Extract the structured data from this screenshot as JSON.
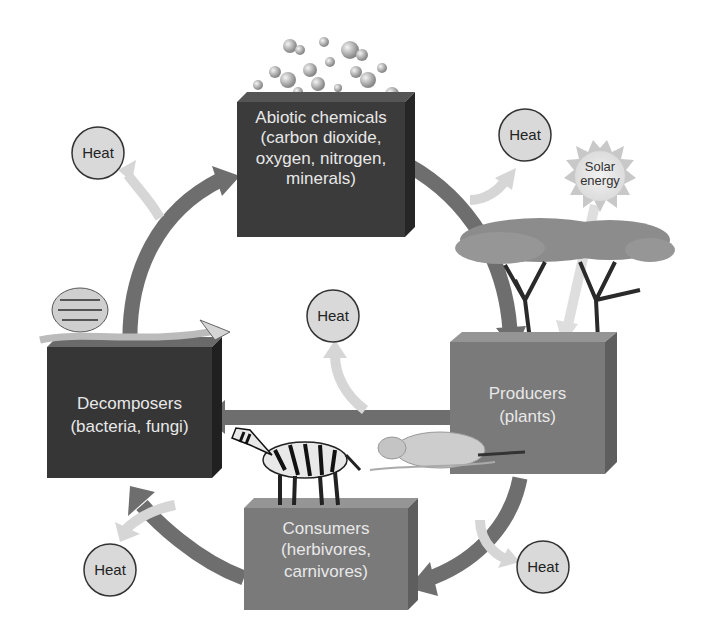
{
  "diagram": {
    "type": "nutrient cycle / energy flow",
    "colors": {
      "dark_box": "#3b3b3b",
      "mid_box": "#7a7a7a",
      "cycle_arrow": "#6e6e6e",
      "heat_arrow": "#d6d6d6",
      "heat_circle": "#d9d9d9",
      "background": "#ffffff"
    },
    "nodes": {
      "abiotic": {
        "line1": "Abiotic chemicals",
        "line2": "(carbon dioxide,",
        "line3": "oxygen, nitrogen,",
        "line4": "minerals)"
      },
      "producers": {
        "line1": "Producers",
        "line2": "(plants)"
      },
      "consumers": {
        "line1": "Consumers",
        "line2": "(herbivores,",
        "line3": "carnivores)"
      },
      "decomposers": {
        "line1": "Decomposers",
        "line2": "(bacteria, fungi)"
      }
    },
    "heat_labels": [
      "Heat",
      "Heat",
      "Heat",
      "Heat",
      "Heat"
    ],
    "solar": {
      "line1": "Solar",
      "line2": "energy"
    },
    "edges": [
      {
        "from": "Abiotic chemicals",
        "to": "Producers"
      },
      {
        "from": "Producers",
        "to": "Consumers"
      },
      {
        "from": "Producers",
        "to": "Decomposers"
      },
      {
        "from": "Consumers",
        "to": "Decomposers"
      },
      {
        "from": "Decomposers",
        "to": "Abiotic chemicals"
      },
      {
        "from": "Solar energy",
        "to": "Producers"
      }
    ]
  }
}
